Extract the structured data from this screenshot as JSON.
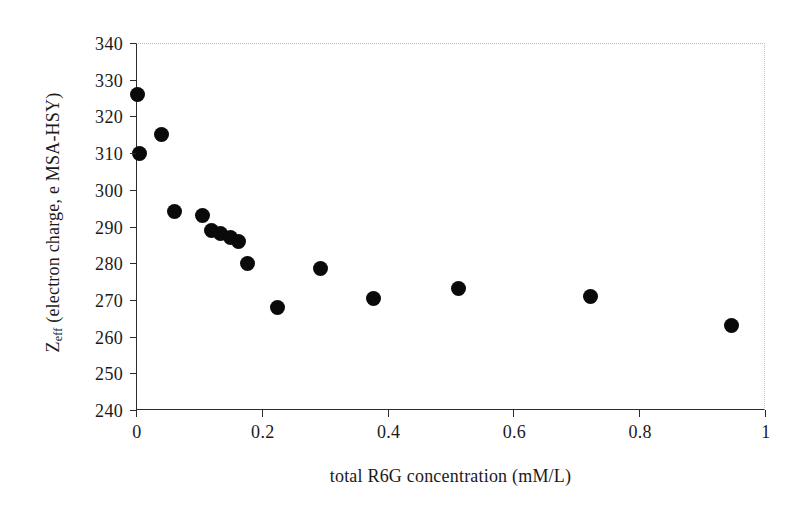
{
  "chart_data": {
    "type": "scatter",
    "title": "",
    "xlabel": "total R6G concentration (mM/L)",
    "ylabel_main": "Z",
    "ylabel_sub": "eff",
    "ylabel_rest": "(electron charge, e MSA-HSY)",
    "xlim": [
      0,
      1
    ],
    "ylim": [
      240,
      340
    ],
    "xticks": [
      0,
      0.2,
      0.4,
      0.6,
      0.8,
      1
    ],
    "xtick_labels": [
      "0",
      "0.2",
      "0.4",
      "0.6",
      "0.8",
      "1"
    ],
    "yticks": [
      240,
      250,
      260,
      270,
      280,
      290,
      300,
      310,
      320,
      330,
      340
    ],
    "ytick_labels": [
      "240",
      "250",
      "260",
      "270",
      "280",
      "290",
      "300",
      "310",
      "320",
      "330",
      "340"
    ],
    "grid": false,
    "legend": null,
    "marker": {
      "shape": "circle",
      "color": "#0a0a0a",
      "size_px": 15
    },
    "series": [
      {
        "name": "Zeff vs total R6G concentration",
        "x": [
          0.002,
          0.04,
          0.005,
          0.062,
          0.105,
          0.12,
          0.135,
          0.15,
          0.163,
          0.177,
          0.225,
          0.293,
          0.378,
          0.513,
          0.723,
          0.947
        ],
        "y": [
          326,
          315,
          310,
          294,
          293,
          289,
          288,
          287,
          286,
          280,
          268,
          278.5,
          270.5,
          273,
          270.8,
          263
        ]
      }
    ]
  }
}
